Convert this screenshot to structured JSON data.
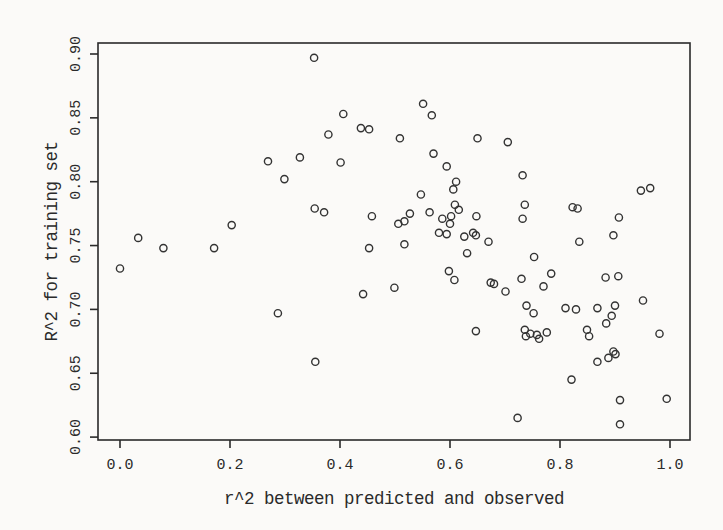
{
  "figure": {
    "background_color": "#fbfaf8",
    "ink_color": "#2a2a2a",
    "marker_color": "#333333"
  },
  "chart_data": {
    "type": "scatter",
    "title": "",
    "xlabel": "r^2 between predicted and observed",
    "ylabel": "R^2 for training set",
    "xlim": [
      0.0,
      1.0
    ],
    "ylim": [
      0.6,
      0.9
    ],
    "x_ticks": [
      "0.0",
      "0.2",
      "0.4",
      "0.6",
      "0.8",
      "1.0"
    ],
    "y_ticks": [
      "0.60",
      "0.65",
      "0.70",
      "0.75",
      "0.80",
      "0.85",
      "0.90"
    ],
    "grid": false,
    "legend": null,
    "marker": "open-circle",
    "points": [
      [
        0.0,
        0.732
      ],
      [
        0.033,
        0.756
      ],
      [
        0.079,
        0.748
      ],
      [
        0.171,
        0.748
      ],
      [
        0.203,
        0.766
      ],
      [
        0.269,
        0.816
      ],
      [
        0.287,
        0.697
      ],
      [
        0.299,
        0.802
      ],
      [
        0.327,
        0.819
      ],
      [
        0.353,
        0.897
      ],
      [
        0.354,
        0.779
      ],
      [
        0.355,
        0.659
      ],
      [
        0.371,
        0.776
      ],
      [
        0.379,
        0.837
      ],
      [
        0.401,
        0.815
      ],
      [
        0.406,
        0.853
      ],
      [
        0.438,
        0.842
      ],
      [
        0.442,
        0.712
      ],
      [
        0.453,
        0.841
      ],
      [
        0.453,
        0.748
      ],
      [
        0.458,
        0.773
      ],
      [
        0.499,
        0.717
      ],
      [
        0.506,
        0.767
      ],
      [
        0.509,
        0.834
      ],
      [
        0.517,
        0.769
      ],
      [
        0.517,
        0.751
      ],
      [
        0.527,
        0.775
      ],
      [
        0.547,
        0.79
      ],
      [
        0.551,
        0.861
      ],
      [
        0.563,
        0.776
      ],
      [
        0.567,
        0.852
      ],
      [
        0.57,
        0.822
      ],
      [
        0.58,
        0.76
      ],
      [
        0.586,
        0.771
      ],
      [
        0.594,
        0.812
      ],
      [
        0.594,
        0.759
      ],
      [
        0.598,
        0.73
      ],
      [
        0.6,
        0.767
      ],
      [
        0.602,
        0.773
      ],
      [
        0.606,
        0.794
      ],
      [
        0.608,
        0.723
      ],
      [
        0.609,
        0.782
      ],
      [
        0.611,
        0.8
      ],
      [
        0.616,
        0.778
      ],
      [
        0.626,
        0.757
      ],
      [
        0.631,
        0.744
      ],
      [
        0.642,
        0.76
      ],
      [
        0.647,
        0.758
      ],
      [
        0.647,
        0.683
      ],
      [
        0.648,
        0.773
      ],
      [
        0.65,
        0.834
      ],
      [
        0.67,
        0.753
      ],
      [
        0.674,
        0.721
      ],
      [
        0.68,
        0.72
      ],
      [
        0.701,
        0.714
      ],
      [
        0.705,
        0.831
      ],
      [
        0.723,
        0.615
      ],
      [
        0.73,
        0.724
      ],
      [
        0.732,
        0.805
      ],
      [
        0.732,
        0.771
      ],
      [
        0.736,
        0.782
      ],
      [
        0.736,
        0.684
      ],
      [
        0.738,
        0.679
      ],
      [
        0.739,
        0.703
      ],
      [
        0.746,
        0.681
      ],
      [
        0.752,
        0.697
      ],
      [
        0.753,
        0.741
      ],
      [
        0.758,
        0.68
      ],
      [
        0.762,
        0.677
      ],
      [
        0.77,
        0.718
      ],
      [
        0.776,
        0.682
      ],
      [
        0.784,
        0.728
      ],
      [
        0.81,
        0.701
      ],
      [
        0.821,
        0.645
      ],
      [
        0.823,
        0.78
      ],
      [
        0.829,
        0.7
      ],
      [
        0.832,
        0.779
      ],
      [
        0.835,
        0.753
      ],
      [
        0.849,
        0.684
      ],
      [
        0.853,
        0.679
      ],
      [
        0.868,
        0.701
      ],
      [
        0.868,
        0.659
      ],
      [
        0.883,
        0.725
      ],
      [
        0.884,
        0.689
      ],
      [
        0.888,
        0.662
      ],
      [
        0.894,
        0.695
      ],
      [
        0.897,
        0.667
      ],
      [
        0.897,
        0.758
      ],
      [
        0.9,
        0.703
      ],
      [
        0.901,
        0.665
      ],
      [
        0.906,
        0.726
      ],
      [
        0.907,
        0.772
      ],
      [
        0.909,
        0.629
      ],
      [
        0.909,
        0.61
      ],
      [
        0.947,
        0.793
      ],
      [
        0.951,
        0.707
      ],
      [
        0.964,
        0.795
      ],
      [
        0.981,
        0.681
      ],
      [
        0.994,
        0.63
      ]
    ]
  }
}
